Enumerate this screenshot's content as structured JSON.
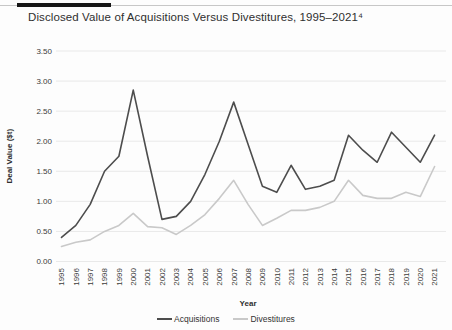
{
  "page": {
    "title": "Disclosed Value of Acquisitions Versus Divestitures, 1995–2021⁴"
  },
  "chart_data": {
    "type": "line",
    "title": "Disclosed Value of Acquisitions Versus Divestitures, 1995–2021⁴",
    "xlabel": "Year",
    "ylabel": "Deal Value ($t)",
    "ylim": [
      0,
      3.5
    ],
    "ytick_step": 0.5,
    "ytick_labels": [
      "0.00",
      "0.50",
      "1.00",
      "1.50",
      "2.00",
      "2.50",
      "3.00",
      "3.50"
    ],
    "grid": true,
    "legend_position": "bottom",
    "categories": [
      "1995",
      "1996",
      "1997",
      "1998",
      "1999",
      "2000",
      "2001",
      "2002",
      "2003",
      "2004",
      "2005",
      "2006",
      "2007",
      "2008",
      "2009",
      "2010",
      "2011",
      "2012",
      "2013",
      "2014",
      "2015",
      "2016",
      "2017",
      "2018",
      "2019",
      "2020",
      "2021"
    ],
    "series": [
      {
        "name": "Acquisitions",
        "color": "#4d4d4d",
        "values": [
          0.4,
          0.6,
          0.95,
          1.5,
          1.75,
          2.85,
          1.75,
          0.7,
          0.75,
          1.0,
          1.45,
          2.0,
          2.65,
          1.95,
          1.25,
          1.15,
          1.6,
          1.2,
          1.25,
          1.35,
          2.1,
          1.85,
          1.65,
          2.15,
          1.9,
          1.65,
          2.1
        ]
      },
      {
        "name": "Divestitures",
        "color": "#c9c9c9",
        "values": [
          0.25,
          0.32,
          0.36,
          0.5,
          0.6,
          0.8,
          0.58,
          0.56,
          0.45,
          0.6,
          0.78,
          1.05,
          1.35,
          0.95,
          0.6,
          0.72,
          0.85,
          0.85,
          0.9,
          1.0,
          1.35,
          1.1,
          1.05,
          1.05,
          1.15,
          1.08,
          1.58
        ]
      }
    ],
    "colors": {
      "gridline": "#e9e9e9",
      "tick_text": "#3b3b3b",
      "axis_label_text": "#2f2f2f"
    }
  }
}
